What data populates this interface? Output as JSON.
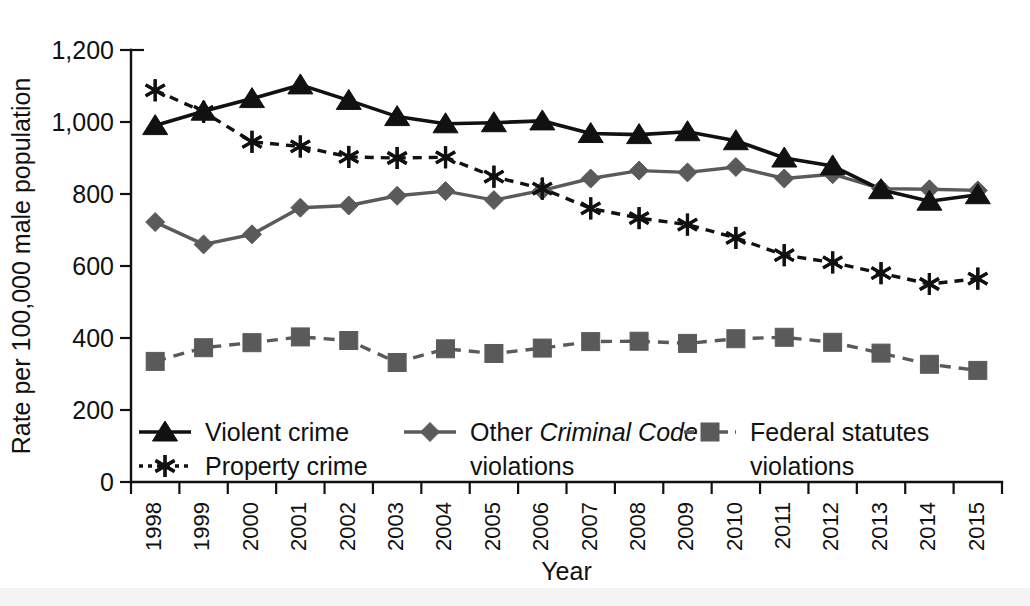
{
  "chart_data": {
    "type": "line",
    "title": "",
    "xlabel": "Year",
    "ylabel": "Rate per 100,000 male population",
    "ylim": [
      0,
      1200
    ],
    "yticks": [
      0,
      200,
      400,
      600,
      800,
      1000,
      1200
    ],
    "ytick_labels": [
      "0",
      "200",
      "400",
      "600",
      "800",
      "1,000",
      "1,200"
    ],
    "grid": false,
    "legend_position": "inside-bottom-left",
    "categories": [
      1998,
      1999,
      2000,
      2001,
      2002,
      2003,
      2004,
      2005,
      2006,
      2007,
      2008,
      2009,
      2010,
      2011,
      2012,
      2013,
      2014,
      2015
    ],
    "xtick_labels": [
      "1998",
      "1999",
      "2000",
      "2001",
      "2002",
      "2003",
      "2004",
      "2005",
      "2006",
      "2007",
      "2008",
      "2009",
      "2010",
      "2011",
      "2012",
      "2013",
      "2014",
      "2015"
    ],
    "series": [
      {
        "name": "Violent crime",
        "marker": "triangle",
        "line_style": "solid",
        "color": "#111111",
        "values": [
          990,
          1030,
          1065,
          1103,
          1060,
          1015,
          995,
          998,
          1003,
          968,
          965,
          973,
          948,
          900,
          878,
          812,
          780,
          798
        ]
      },
      {
        "name": "Property crime",
        "marker": "asterisk",
        "line_style": "dotted",
        "color": "#111111",
        "values": [
          1088,
          1028,
          945,
          932,
          903,
          900,
          902,
          848,
          815,
          760,
          733,
          715,
          678,
          630,
          610,
          580,
          550,
          565
        ]
      },
      {
        "name": "Other Criminal Code violations",
        "marker": "diamond",
        "line_style": "solid",
        "color": "#5a5a5a",
        "values": [
          722,
          660,
          688,
          762,
          768,
          795,
          808,
          783,
          810,
          843,
          865,
          860,
          875,
          843,
          855,
          815,
          813,
          810
        ]
      },
      {
        "name": "Federal statutes violations",
        "marker": "square",
        "line_style": "dashed",
        "color": "#5a5a5a",
        "values": [
          335,
          373,
          387,
          403,
          393,
          332,
          370,
          357,
          372,
          390,
          391,
          385,
          398,
          402,
          388,
          358,
          327,
          310
        ]
      }
    ]
  },
  "axes": {
    "y_title": "Rate per 100,000 male population",
    "x_title": "Year"
  },
  "legend": {
    "items": [
      {
        "label": "Violent crime",
        "marker": "triangle",
        "style": "solid",
        "color": "#111111"
      },
      {
        "label": "Property crime",
        "marker": "asterisk",
        "style": "dotted",
        "color": "#111111"
      },
      {
        "label_pre": "Other ",
        "label_italic": "Criminal Code",
        "label_post": "",
        "label_line2": "violations",
        "marker": "diamond",
        "style": "solid",
        "color": "#5a5a5a"
      },
      {
        "label": "Federal statutes",
        "label_line2": "violations",
        "marker": "square",
        "style": "dashed",
        "color": "#5a5a5a"
      }
    ]
  }
}
